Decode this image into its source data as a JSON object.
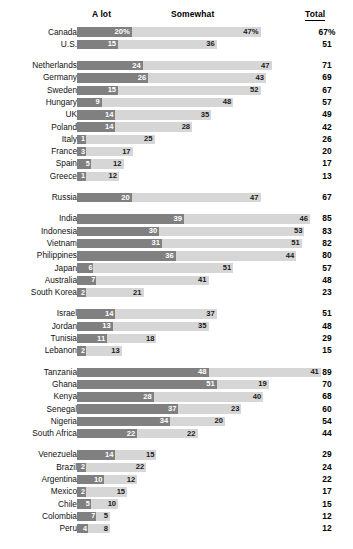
{
  "header": {
    "col_alot": "A lot",
    "col_somewhat": "Somewhat",
    "col_total": "Total"
  },
  "colors": {
    "a_lot": "#808080",
    "somewhat": "#d6d6d6",
    "text": "#1a1a1a",
    "background": "#ffffff"
  },
  "chart_data": {
    "type": "bar",
    "title": "",
    "subtitle": "",
    "xlabel": "",
    "ylabel": "",
    "orientation": "horizontal",
    "stacked": true,
    "grid": false,
    "legend_position": "top",
    "xlim": [
      0,
      100
    ],
    "categories": [
      "Canada",
      "U.S.",
      "Netherlands",
      "Germany",
      "Sweden",
      "Hungary",
      "UK",
      "Poland",
      "Italy",
      "France",
      "Spain",
      "Greece",
      "Russia",
      "India",
      "Indonesia",
      "Vietnam",
      "Philippines",
      "Japan",
      "Australia",
      "South Korea",
      "Israel",
      "Jordan",
      "Tunisia",
      "Lebanon",
      "Tanzania",
      "Ghana",
      "Kenya",
      "Senegal",
      "Nigeria",
      "South Africa",
      "Venezuela",
      "Brazil",
      "Argentina",
      "Mexico",
      "Chile",
      "Colombia",
      "Peru"
    ],
    "series": [
      {
        "name": "A lot",
        "values": [
          20,
          15,
          24,
          26,
          15,
          9,
          14,
          14,
          1,
          3,
          5,
          1,
          20,
          39,
          30,
          31,
          36,
          6,
          7,
          2,
          14,
          13,
          11,
          2,
          48,
          51,
          28,
          37,
          34,
          22,
          14,
          2,
          10,
          2,
          5,
          7,
          4
        ]
      },
      {
        "name": "Somewhat",
        "values": [
          47,
          36,
          47,
          43,
          52,
          48,
          35,
          28,
          25,
          17,
          12,
          12,
          47,
          46,
          53,
          51,
          44,
          51,
          41,
          21,
          37,
          35,
          18,
          13,
          41,
          19,
          40,
          23,
          20,
          22,
          15,
          22,
          12,
          15,
          10,
          5,
          8
        ]
      }
    ],
    "totals": [
      67,
      51,
      71,
      69,
      67,
      57,
      49,
      42,
      26,
      20,
      17,
      13,
      67,
      85,
      83,
      82,
      80,
      57,
      48,
      23,
      51,
      48,
      29,
      15,
      89,
      70,
      68,
      60,
      54,
      44,
      29,
      24,
      22,
      17,
      15,
      12,
      12
    ]
  },
  "rows": [
    {
      "name": "Canada",
      "a_lot": 20,
      "a_lot_label": "20%",
      "somewhat": 47,
      "somewhat_label": "47%",
      "total": "67%",
      "group_start": false
    },
    {
      "name": "U.S.",
      "a_lot": 15,
      "a_lot_label": "15",
      "somewhat": 36,
      "somewhat_label": "36",
      "total": "51",
      "group_start": false
    },
    {
      "name": "Netherlands",
      "a_lot": 24,
      "a_lot_label": "24",
      "somewhat": 47,
      "somewhat_label": "47",
      "total": "71",
      "group_start": true
    },
    {
      "name": "Germany",
      "a_lot": 26,
      "a_lot_label": "26",
      "somewhat": 43,
      "somewhat_label": "43",
      "total": "69",
      "group_start": false
    },
    {
      "name": "Sweden",
      "a_lot": 15,
      "a_lot_label": "15",
      "somewhat": 52,
      "somewhat_label": "52",
      "total": "67",
      "group_start": false
    },
    {
      "name": "Hungary",
      "a_lot": 9,
      "a_lot_label": "9",
      "somewhat": 48,
      "somewhat_label": "48",
      "total": "57",
      "group_start": false
    },
    {
      "name": "UK",
      "a_lot": 14,
      "a_lot_label": "14",
      "somewhat": 35,
      "somewhat_label": "35",
      "total": "49",
      "group_start": false
    },
    {
      "name": "Poland",
      "a_lot": 14,
      "a_lot_label": "14",
      "somewhat": 28,
      "somewhat_label": "28",
      "total": "42",
      "group_start": false
    },
    {
      "name": "Italy",
      "a_lot": 1,
      "a_lot_label": "1",
      "somewhat": 25,
      "somewhat_label": "25",
      "total": "26",
      "group_start": false
    },
    {
      "name": "France",
      "a_lot": 3,
      "a_lot_label": "3",
      "somewhat": 17,
      "somewhat_label": "17",
      "total": "20",
      "group_start": false
    },
    {
      "name": "Spain",
      "a_lot": 5,
      "a_lot_label": "5",
      "somewhat": 12,
      "somewhat_label": "12",
      "total": "17",
      "group_start": false
    },
    {
      "name": "Greece",
      "a_lot": 1,
      "a_lot_label": "1",
      "somewhat": 12,
      "somewhat_label": "12",
      "total": "13",
      "group_start": false
    },
    {
      "name": "Russia",
      "a_lot": 20,
      "a_lot_label": "20",
      "somewhat": 47,
      "somewhat_label": "47",
      "total": "67",
      "group_start": true
    },
    {
      "name": "India",
      "a_lot": 39,
      "a_lot_label": "39",
      "somewhat": 46,
      "somewhat_label": "46",
      "total": "85",
      "group_start": true
    },
    {
      "name": "Indonesia",
      "a_lot": 30,
      "a_lot_label": "30",
      "somewhat": 53,
      "somewhat_label": "53",
      "total": "83",
      "group_start": false
    },
    {
      "name": "Vietnam",
      "a_lot": 31,
      "a_lot_label": "31",
      "somewhat": 51,
      "somewhat_label": "51",
      "total": "82",
      "group_start": false
    },
    {
      "name": "Philippines",
      "a_lot": 36,
      "a_lot_label": "36",
      "somewhat": 44,
      "somewhat_label": "44",
      "total": "80",
      "group_start": false
    },
    {
      "name": "Japan",
      "a_lot": 6,
      "a_lot_label": "6",
      "somewhat": 51,
      "somewhat_label": "51",
      "total": "57",
      "group_start": false
    },
    {
      "name": "Australia",
      "a_lot": 7,
      "a_lot_label": "7",
      "somewhat": 41,
      "somewhat_label": "41",
      "total": "48",
      "group_start": false
    },
    {
      "name": "South Korea",
      "a_lot": 2,
      "a_lot_label": "2",
      "somewhat": 21,
      "somewhat_label": "21",
      "total": "23",
      "group_start": false
    },
    {
      "name": "Israel",
      "a_lot": 14,
      "a_lot_label": "14",
      "somewhat": 37,
      "somewhat_label": "37",
      "total": "51",
      "group_start": true
    },
    {
      "name": "Jordan",
      "a_lot": 13,
      "a_lot_label": "13",
      "somewhat": 35,
      "somewhat_label": "35",
      "total": "48",
      "group_start": false
    },
    {
      "name": "Tunisia",
      "a_lot": 11,
      "a_lot_label": "11",
      "somewhat": 18,
      "somewhat_label": "18",
      "total": "29",
      "group_start": false
    },
    {
      "name": "Lebanon",
      "a_lot": 2,
      "a_lot_label": "2",
      "somewhat": 13,
      "somewhat_label": "13",
      "total": "15",
      "group_start": false
    },
    {
      "name": "Tanzania",
      "a_lot": 48,
      "a_lot_label": "48",
      "somewhat": 41,
      "somewhat_label": "41",
      "total": "89",
      "group_start": true
    },
    {
      "name": "Ghana",
      "a_lot": 51,
      "a_lot_label": "51",
      "somewhat": 19,
      "somewhat_label": "19",
      "total": "70",
      "group_start": false
    },
    {
      "name": "Kenya",
      "a_lot": 28,
      "a_lot_label": "28",
      "somewhat": 40,
      "somewhat_label": "40",
      "total": "68",
      "group_start": false
    },
    {
      "name": "Senegal",
      "a_lot": 37,
      "a_lot_label": "37",
      "somewhat": 23,
      "somewhat_label": "23",
      "total": "60",
      "group_start": false
    },
    {
      "name": "Nigeria",
      "a_lot": 34,
      "a_lot_label": "34",
      "somewhat": 20,
      "somewhat_label": "20",
      "total": "54",
      "group_start": false
    },
    {
      "name": "South Africa",
      "a_lot": 22,
      "a_lot_label": "22",
      "somewhat": 22,
      "somewhat_label": "22",
      "total": "44",
      "group_start": false
    },
    {
      "name": "Venezuela",
      "a_lot": 14,
      "a_lot_label": "14",
      "somewhat": 15,
      "somewhat_label": "15",
      "total": "29",
      "group_start": true
    },
    {
      "name": "Brazil",
      "a_lot": 2,
      "a_lot_label": "2",
      "somewhat": 22,
      "somewhat_label": "22",
      "total": "24",
      "group_start": false
    },
    {
      "name": "Argentina",
      "a_lot": 10,
      "a_lot_label": "10",
      "somewhat": 12,
      "somewhat_label": "12",
      "total": "22",
      "group_start": false
    },
    {
      "name": "Mexico",
      "a_lot": 2,
      "a_lot_label": "2",
      "somewhat": 15,
      "somewhat_label": "15",
      "total": "17",
      "group_start": false
    },
    {
      "name": "Chile",
      "a_lot": 5,
      "a_lot_label": "5",
      "somewhat": 10,
      "somewhat_label": "10",
      "total": "15",
      "group_start": false
    },
    {
      "name": "Colombia",
      "a_lot": 7,
      "a_lot_label": "7",
      "somewhat": 5,
      "somewhat_label": "5",
      "total": "12",
      "group_start": false
    },
    {
      "name": "Peru",
      "a_lot": 4,
      "a_lot_label": "4",
      "somewhat": 8,
      "somewhat_label": "8",
      "total": "12",
      "group_start": false
    }
  ]
}
